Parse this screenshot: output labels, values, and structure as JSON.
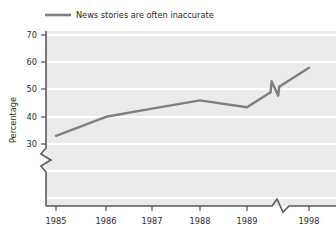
{
  "chart_data": {
    "type": "line",
    "title": "",
    "subtitle": "",
    "xlabel": "",
    "ylabel": "Percentage",
    "legend": [
      {
        "label": "News stories are often inaccurate",
        "color": "#7f7f7f"
      }
    ],
    "legend_position": "top-left",
    "grid": true,
    "grid_color": "#ffffff",
    "plot_background": "#ecebeb",
    "x": [
      1985,
      1986,
      1987,
      1988,
      1989,
      1998
    ],
    "categories": [
      "1985",
      "1986",
      "1987",
      "1988",
      "1989",
      "1998"
    ],
    "xtick_labels": [
      "1985",
      "1986",
      "1987",
      "1988",
      "1989",
      "1998"
    ],
    "ytick_labels": [
      "30",
      "40",
      "50",
      "60",
      "70"
    ],
    "ytick_values": [
      30,
      40,
      50,
      60,
      70
    ],
    "ylim": [
      30,
      70
    ],
    "y_axis_break": true,
    "x_axis_break": true,
    "line_break_between": [
      "1989",
      "1998"
    ],
    "series": [
      {
        "name": "News stories are often inaccurate",
        "color": "#7f7f7f",
        "values": [
          33,
          40,
          43,
          46,
          43.5,
          58
        ]
      }
    ]
  },
  "axes": {
    "y_title": "Percentage",
    "y_ticks": [
      "70",
      "60",
      "50",
      "40",
      "30"
    ],
    "x_ticks": [
      "1985",
      "1986",
      "1987",
      "1988",
      "1989",
      "1998"
    ]
  },
  "legend": {
    "entry_label": "News stories are often inaccurate"
  },
  "colors": {
    "series": "#7f7f7f",
    "axis": "#5a5a5a",
    "plot_bg": "#ecebeb",
    "gridline": "#ffffff",
    "text": "#2b2b2b"
  }
}
